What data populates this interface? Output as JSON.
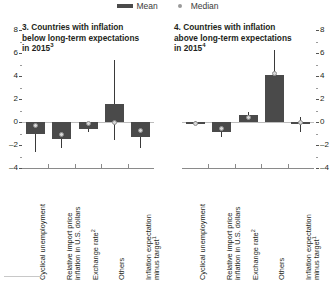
{
  "legend": {
    "mean_label": "Mean",
    "median_label": "Median",
    "mean_color": "#4a4a4a",
    "median_color": "#d9d9d9"
  },
  "panels": [
    {
      "id": "panel-3",
      "title": "3. Countries with inflation\nbelow long-term expectations\nin 2015",
      "title_superscript": "3",
      "axis_side": "left"
    },
    {
      "id": "panel-4",
      "title": "4. Countries with inflation\nabove long-term expectations\nin 2015",
      "title_superscript": "4",
      "axis_side": "right"
    }
  ],
  "yticks": [
    "8",
    "6",
    "4",
    "2",
    "0",
    "-2",
    "-4"
  ],
  "categories": [
    {
      "line1": "Cyclical unemployment",
      "line2": "",
      "sup": ""
    },
    {
      "line1": "Relative import price",
      "line2": "inflation in U.S. dollars",
      "sup": ""
    },
    {
      "line1": "Exchange rate",
      "line2": "",
      "sup": "2"
    },
    {
      "line1": "Others",
      "line2": "",
      "sup": ""
    },
    {
      "line1": "Inflation expectation",
      "line2": "minus target",
      "sup": "1"
    }
  ],
  "chart_data": {
    "type": "bar",
    "xlabel": "",
    "ylabel": "",
    "ylim": [
      -4,
      8
    ],
    "yticks": [
      -4,
      -2,
      0,
      2,
      4,
      6,
      8
    ],
    "grid": false,
    "legend_position": "top-center",
    "categories": [
      "Cyclical unemployment",
      "Relative import price inflation in U.S. dollars",
      "Exchange rate",
      "Others",
      "Inflation expectation minus target"
    ],
    "panels": [
      {
        "name": "3. Countries with inflation below long-term expectations in 2015",
        "series": [
          {
            "name": "Mean",
            "values": [
              -1.0,
              -1.5,
              -0.6,
              1.6,
              -1.3
            ]
          },
          {
            "name": "Median",
            "values": [
              -0.3,
              -1.1,
              -0.15,
              -0.05,
              -0.7
            ]
          }
        ],
        "ranges": [
          {
            "low": -2.6,
            "high": 0.0
          },
          {
            "low": -2.3,
            "high": 0.0
          },
          {
            "low": -0.9,
            "high": 0.0
          },
          {
            "low": -1.6,
            "high": 5.4
          },
          {
            "low": -2.3,
            "high": 0.0
          }
        ]
      },
      {
        "name": "4. Countries with inflation above long-term expectations in 2015",
        "series": [
          {
            "name": "Mean",
            "values": [
              -0.15,
              -0.9,
              0.6,
              4.1,
              -0.05
            ]
          },
          {
            "name": "Median",
            "values": [
              -0.15,
              -0.6,
              0.35,
              4.2,
              0.0
            ]
          }
        ],
        "ranges": [
          {
            "low": -0.3,
            "high": 0.1
          },
          {
            "low": -1.3,
            "high": 0.0
          },
          {
            "low": 0.0,
            "high": 0.9
          },
          {
            "low": 1.2,
            "high": 6.3
          },
          {
            "low": -0.9,
            "high": 0.4
          }
        ]
      }
    ]
  }
}
